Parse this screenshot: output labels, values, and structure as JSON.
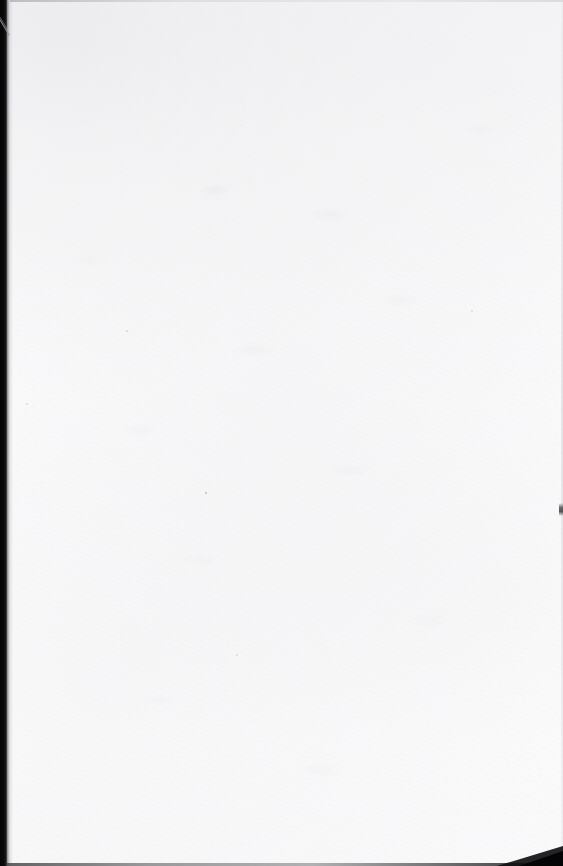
{
  "page": {
    "kind": "scanned-blank-page",
    "width": 563,
    "height": 866,
    "body_text": "",
    "caption": ""
  },
  "colors": {
    "paper": "#fdfdfd",
    "paper_shade": "#ededf0",
    "gutter_black": "#050505",
    "gutter_falloff": "#787880",
    "edge_line": "#c4c4c9",
    "bottom_edge": "#3c3c3e",
    "speck": "#96969c"
  },
  "artifacts": {
    "gutter": {
      "name": "scanner-gutter",
      "side": "left",
      "width": 7
    },
    "arc": {
      "name": "gutter-arc",
      "description": ""
    },
    "edges": {
      "top": "",
      "right": "",
      "bottom": ""
    },
    "corner_wedge": {
      "name": "bottom-right-corner-wedge",
      "description": ""
    },
    "edge_nick": {
      "name": "right-edge-nick",
      "y": 505
    },
    "specks": [
      {
        "x": 205,
        "y": 492,
        "size": 2
      },
      {
        "x": 126,
        "y": 330,
        "size": 2
      },
      {
        "x": 26,
        "y": 403,
        "size": 2
      },
      {
        "x": 471,
        "y": 310,
        "size": 2
      },
      {
        "x": 236,
        "y": 654,
        "size": 2
      }
    ]
  }
}
